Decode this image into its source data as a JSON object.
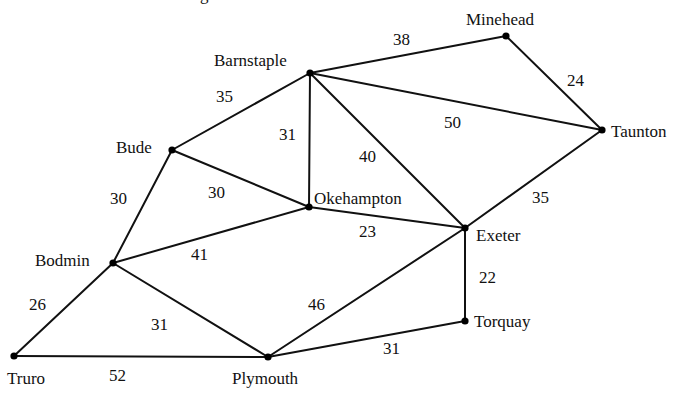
{
  "diagram": {
    "type": "weighted-undirected-graph",
    "top_fragment": "g",
    "colors": {
      "stroke": "#111111",
      "node": "#000000",
      "background": "#ffffff"
    },
    "nodes": [
      {
        "id": "barnstaple",
        "label": "Barnstaple",
        "x": 310,
        "y": 73,
        "lx": 214,
        "ly": 66
      },
      {
        "id": "minehead",
        "label": "Minehead",
        "x": 506,
        "y": 36,
        "lx": 466,
        "ly": 25
      },
      {
        "id": "taunton",
        "label": "Taunton",
        "x": 602,
        "y": 130,
        "lx": 611,
        "ly": 137
      },
      {
        "id": "bude",
        "label": "Bude",
        "x": 172,
        "y": 150,
        "lx": 116,
        "ly": 153
      },
      {
        "id": "okehampton",
        "label": "Okehampton",
        "x": 309,
        "y": 207,
        "lx": 314,
        "ly": 204
      },
      {
        "id": "exeter",
        "label": "Exeter",
        "x": 465,
        "y": 228,
        "lx": 476,
        "ly": 241
      },
      {
        "id": "bodmin",
        "label": "Bodmin",
        "x": 113,
        "y": 263,
        "lx": 35,
        "ly": 266
      },
      {
        "id": "torquay",
        "label": "Torquay",
        "x": 465,
        "y": 321,
        "lx": 474,
        "ly": 327
      },
      {
        "id": "truro",
        "label": "Truro",
        "x": 14,
        "y": 356,
        "lx": 7,
        "ly": 384
      },
      {
        "id": "plymouth",
        "label": "Plymouth",
        "x": 268,
        "y": 357,
        "lx": 232,
        "ly": 384
      }
    ],
    "edges": [
      {
        "from": "barnstaple",
        "to": "minehead",
        "weight": "38",
        "wx": 393,
        "wy": 45
      },
      {
        "from": "minehead",
        "to": "taunton",
        "weight": "24",
        "wx": 567,
        "wy": 86
      },
      {
        "from": "barnstaple",
        "to": "taunton",
        "weight": "50",
        "wx": 444,
        "wy": 128
      },
      {
        "from": "barnstaple",
        "to": "bude",
        "weight": "35",
        "wx": 216,
        "wy": 102
      },
      {
        "from": "barnstaple",
        "to": "okehampton",
        "weight": "31",
        "wx": 279,
        "wy": 140
      },
      {
        "from": "barnstaple",
        "to": "exeter",
        "weight": "40",
        "wx": 359,
        "wy": 162
      },
      {
        "from": "bude",
        "to": "okehampton",
        "weight": "30",
        "wx": 208,
        "wy": 198
      },
      {
        "from": "bude",
        "to": "bodmin",
        "weight": "30",
        "wx": 110,
        "wy": 204
      },
      {
        "from": "okehampton",
        "to": "exeter",
        "weight": "23",
        "wx": 359,
        "wy": 237
      },
      {
        "from": "taunton",
        "to": "exeter",
        "weight": "35",
        "wx": 532,
        "wy": 203
      },
      {
        "from": "okehampton",
        "to": "bodmin",
        "weight": "41",
        "wx": 191,
        "wy": 260
      },
      {
        "from": "exeter",
        "to": "torquay",
        "weight": "22",
        "wx": 479,
        "wy": 283
      },
      {
        "from": "exeter",
        "to": "plymouth",
        "weight": "46",
        "wx": 308,
        "wy": 310
      },
      {
        "from": "bodmin",
        "to": "truro",
        "weight": "26",
        "wx": 29,
        "wy": 310
      },
      {
        "from": "bodmin",
        "to": "plymouth",
        "weight": "31",
        "wx": 151,
        "wy": 330
      },
      {
        "from": "plymouth",
        "to": "torquay",
        "weight": "31",
        "wx": 383,
        "wy": 354
      },
      {
        "from": "truro",
        "to": "plymouth",
        "weight": "52",
        "wx": 109,
        "wy": 381
      }
    ]
  }
}
